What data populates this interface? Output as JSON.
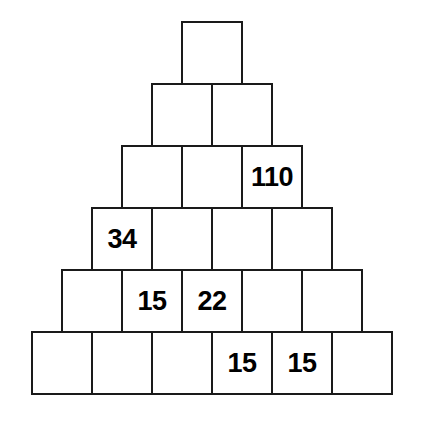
{
  "puzzle": {
    "type": "number-pyramid",
    "rows": [
      {
        "index": 0,
        "cells": [
          {
            "value": ""
          }
        ]
      },
      {
        "index": 1,
        "cells": [
          {
            "value": ""
          },
          {
            "value": ""
          }
        ]
      },
      {
        "index": 2,
        "cells": [
          {
            "value": ""
          },
          {
            "value": ""
          },
          {
            "value": "110"
          }
        ]
      },
      {
        "index": 3,
        "cells": [
          {
            "value": "34"
          },
          {
            "value": ""
          },
          {
            "value": ""
          },
          {
            "value": ""
          }
        ]
      },
      {
        "index": 4,
        "cells": [
          {
            "value": ""
          },
          {
            "value": "15"
          },
          {
            "value": "22"
          },
          {
            "value": ""
          },
          {
            "value": ""
          }
        ]
      },
      {
        "index": 5,
        "cells": [
          {
            "value": ""
          },
          {
            "value": ""
          },
          {
            "value": ""
          },
          {
            "value": "15"
          },
          {
            "value": "15"
          },
          {
            "value": ""
          }
        ]
      }
    ],
    "colors": {
      "border": "#1a1a1a",
      "cell_background": "#ffffff",
      "text": "#000000",
      "page_background": "#ffffff"
    }
  }
}
